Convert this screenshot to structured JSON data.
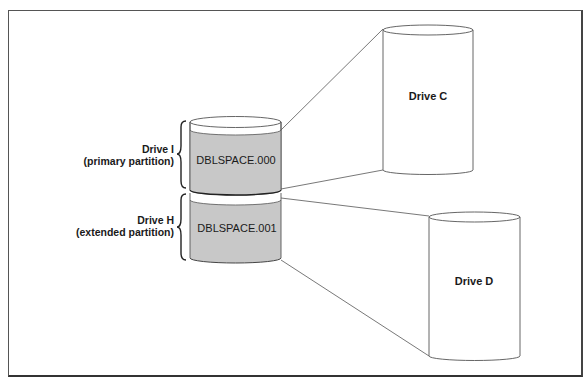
{
  "diagram": {
    "type": "disk-compression-mapping",
    "colors": {
      "frame": "#444444",
      "compressed_fill": "#c8c8c8",
      "outline": "#555555",
      "background": "#ffffff"
    },
    "host_volumes": [
      {
        "label_line1": "Drive I",
        "label_line2": "(primary partition)",
        "file": "DBLSPACE.000",
        "maps_to": "Drive C"
      },
      {
        "label_line1": "Drive H",
        "label_line2": "(extended partition)",
        "file": "DBLSPACE.001",
        "maps_to": "Drive D"
      }
    ],
    "compressed_drives": [
      {
        "label": "Drive C"
      },
      {
        "label": "Drive D"
      }
    ]
  }
}
